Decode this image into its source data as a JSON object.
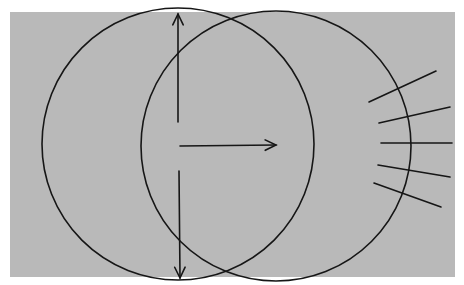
{
  "diagram": {
    "colors": {
      "background": "#ffffff",
      "panel": "#b9b9b9",
      "stroke": "#161616"
    },
    "circles": [
      {
        "name": "left-circle",
        "cx": 178,
        "cy": 144,
        "r": 136
      },
      {
        "name": "right-circle",
        "cx": 276,
        "cy": 146,
        "r": 135
      }
    ],
    "arrows": [
      {
        "name": "vertical-arrow-up",
        "x1": 178,
        "y1": 122,
        "x2": 178,
        "y2": 14
      },
      {
        "name": "vertical-arrow-down",
        "x1": 179,
        "y1": 171,
        "x2": 180,
        "y2": 278
      },
      {
        "name": "horizontal-arrow",
        "x1": 180,
        "y1": 146,
        "x2": 276,
        "y2": 145
      }
    ],
    "rays": [
      {
        "x1": 369,
        "y1": 102,
        "x2": 436,
        "y2": 71
      },
      {
        "x1": 379,
        "y1": 123,
        "x2": 450,
        "y2": 107
      },
      {
        "x1": 381,
        "y1": 143,
        "x2": 452,
        "y2": 143
      },
      {
        "x1": 378,
        "y1": 165,
        "x2": 450,
        "y2": 177
      },
      {
        "x1": 374,
        "y1": 183,
        "x2": 441,
        "y2": 207
      }
    ]
  }
}
